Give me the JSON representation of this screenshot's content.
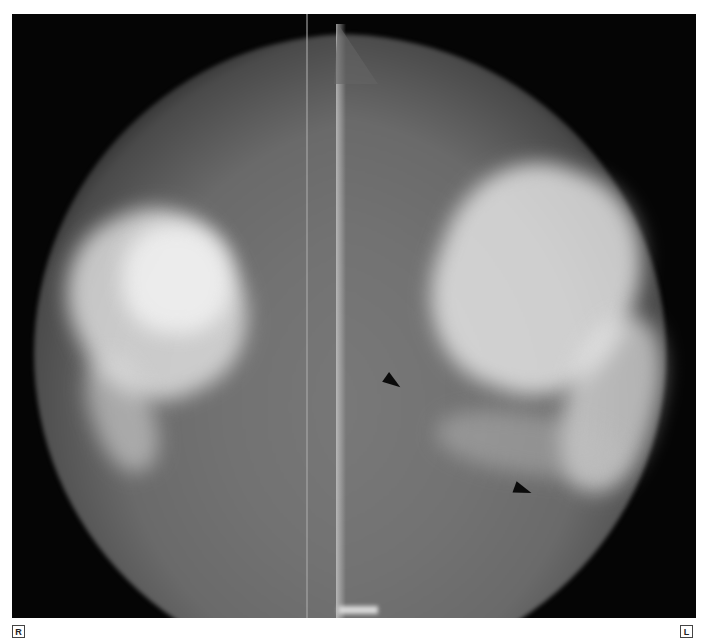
{
  "image": {
    "type": "bilateral mammogram",
    "background_color": "#ffffff",
    "film_color": "#050505"
  },
  "labels": {
    "right_side": "R",
    "left_side": "L"
  },
  "annotations": {
    "arrowheads": [
      {
        "label": "arrowhead-upper",
        "x": 392,
        "y": 385,
        "color": "#0b0b0b"
      },
      {
        "label": "arrowhead-lower",
        "x": 522,
        "y": 488,
        "color": "#0b0b0b"
      }
    ]
  }
}
